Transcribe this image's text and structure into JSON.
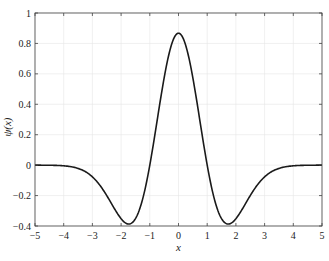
{
  "chart_data": {
    "type": "line",
    "title": "",
    "xlabel": "x",
    "ylabel": "ψ(x)",
    "xlim": [
      -5,
      5
    ],
    "ylim": [
      -0.4,
      1
    ],
    "grid": true,
    "legend": "none",
    "xticks": [
      -5,
      -4,
      -3,
      -2,
      -1,
      0,
      1,
      2,
      3,
      4,
      5
    ],
    "xtick_labels": [
      "−5",
      "−4",
      "−3",
      "−2",
      "−1",
      "0",
      "1",
      "2",
      "3",
      "4",
      "5"
    ],
    "yticks": [
      -0.4,
      -0.2,
      0,
      0.2,
      0.4,
      0.6,
      0.8,
      1
    ],
    "ytick_labels": [
      "−0.4",
      "−0.2",
      "0",
      "0.2",
      "0.4",
      "0.6",
      "0.8",
      "1"
    ],
    "series": [
      {
        "name": "ψ(x) Mexican hat wavelet",
        "x": [
          -5,
          -4.5,
          -4,
          -3.5,
          -3,
          -2.5,
          -2,
          -1.75,
          -1.5,
          -1,
          -0.5,
          0,
          0.5,
          1,
          1.5,
          1.75,
          2,
          2.5,
          3,
          3.5,
          4,
          4.5,
          5
        ],
        "y": [
          -0.0001,
          -0.0014,
          -0.0087,
          -0.0478,
          -0.154,
          -0.2994,
          -0.3519,
          -0.3866,
          -0.3521,
          0,
          0.5738,
          0.8673,
          0.5738,
          0,
          -0.3521,
          -0.3866,
          -0.3519,
          -0.2994,
          -0.154,
          -0.0478,
          -0.0087,
          -0.0014,
          -0.0001
        ]
      }
    ]
  }
}
